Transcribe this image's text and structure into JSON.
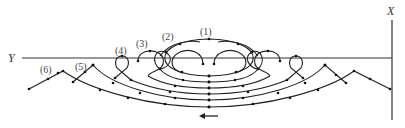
{
  "diagram": {
    "axes": {
      "y_label": "Y",
      "x_label": "X"
    },
    "curve_labels": [
      "(1)",
      "(2)",
      "(3)",
      "(4)",
      "(5)",
      "(6)"
    ],
    "arrow": {
      "direction": "left",
      "glyph": "←"
    },
    "colors": {
      "line": "#222222",
      "label": "#444444",
      "background": "#ffffff"
    }
  }
}
